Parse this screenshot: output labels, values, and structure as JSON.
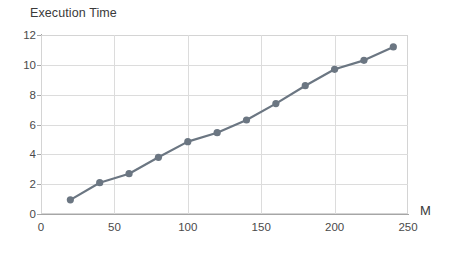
{
  "chart_data": {
    "type": "line",
    "title": "Execution Time",
    "xlabel": "M",
    "ylabel": "",
    "x": [
      20,
      40,
      60,
      80,
      100,
      120,
      140,
      160,
      180,
      200,
      220,
      240
    ],
    "values": [
      0.95,
      2.1,
      2.7,
      3.8,
      4.85,
      5.45,
      6.3,
      7.4,
      8.6,
      9.7,
      10.3,
      11.2
    ],
    "series": [
      {
        "name": "Execution Time",
        "values": [
          0.95,
          2.1,
          2.7,
          3.8,
          4.85,
          5.45,
          6.3,
          7.4,
          8.6,
          9.7,
          10.3,
          11.2
        ]
      }
    ],
    "xlim": [
      0,
      250
    ],
    "ylim": [
      0,
      12
    ],
    "xticks": [
      0,
      50,
      100,
      150,
      200,
      250
    ],
    "yticks": [
      0,
      2,
      4,
      6,
      8,
      10,
      12
    ],
    "xtick_labels": [
      "0",
      "50",
      "100",
      "150",
      "200",
      "250"
    ],
    "ytick_labels": [
      "0",
      "2",
      "4",
      "6",
      "8",
      "10",
      "12"
    ],
    "grid": true,
    "grid_horizontal": true,
    "grid_vertical": true,
    "legend": false,
    "legend_position": "none",
    "marker": "circle",
    "colors": {
      "series_line": "#6b7682",
      "marker": "#6b7682",
      "grid": "#dcdcdc",
      "axis": "#a6a6a6",
      "text": "#3f3f3f",
      "background": "#ffffff"
    }
  }
}
